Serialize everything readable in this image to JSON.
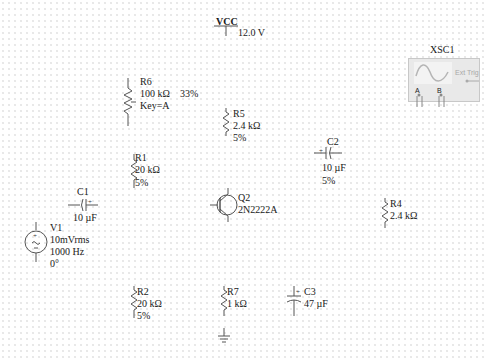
{
  "schematic": {
    "vcc": {
      "name": "VCC",
      "value": "12.0 V"
    },
    "r6": {
      "ref": "R6",
      "value": "100 kΩ",
      "percent": "33%",
      "key": "Key=A"
    },
    "r5": {
      "ref": "R5",
      "value": "2.4 kΩ",
      "tolerance": "5%"
    },
    "r1": {
      "ref": "R1",
      "value": "20 kΩ",
      "tolerance": "5%"
    },
    "c1": {
      "ref": "C1",
      "value": "10 µF"
    },
    "c2": {
      "ref": "C2",
      "value": "10 µF",
      "tolerance": "5%"
    },
    "q2": {
      "ref": "Q2",
      "model": "2N2222A"
    },
    "r4": {
      "ref": "R4",
      "value": "2.4 kΩ"
    },
    "v1": {
      "ref": "V1",
      "amplitude": "10mVrms",
      "frequency": "1000 Hz",
      "phase": "0°"
    },
    "r2": {
      "ref": "R2",
      "value": "20 kΩ",
      "tolerance": "5%"
    },
    "r7": {
      "ref": "R7",
      "value": "1 kΩ"
    },
    "c3": {
      "ref": "C3",
      "value": "47 µF"
    },
    "xsc1": {
      "ref": "XSC1",
      "ext_trig": "Ext Trig",
      "channel_a": "A",
      "channel_b": "B"
    }
  },
  "colors": {
    "wire": "#555555",
    "grid_dot": "#dcdcdc",
    "scope_body": "#e9e9e9",
    "scope_wave": "#b5b5b5",
    "text": "#1a1a1a"
  }
}
